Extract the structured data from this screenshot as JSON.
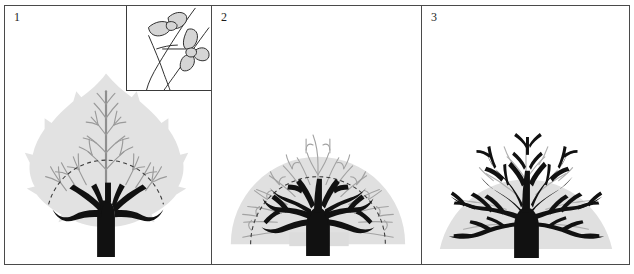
{
  "figure": {
    "background_color": "#ffffff",
    "border_color": "#4a4a4a",
    "width": 634,
    "height": 274
  },
  "palette": {
    "silhouette_fill": "#e2e2e2",
    "silhouette_fill_dark": "#d8d8d8",
    "fine_vein_gray": "#9a9a9a",
    "fine_vein_gray_light": "#b5b5b5",
    "branch_black": "#111111",
    "dashed_arc": "#3c3c3c",
    "inset_leaf_fill": "#d5d5d5",
    "inset_line": "#2b2b2b",
    "panel_border": "#4a4a4a"
  },
  "panels": [
    {
      "number": "1",
      "caption": "",
      "silhouette_shape": "leaf",
      "has_inset": true,
      "dashed_arc_visible": true,
      "black_branch_order_count": 2,
      "fine_gray_vein_count": 26,
      "inset": {
        "content": "twig-with-paired-leaves",
        "leaf_count": 5,
        "stem_count": 3
      }
    },
    {
      "number": "2",
      "caption": "",
      "silhouette_shape": "semicircular-fan",
      "has_inset": false,
      "dashed_arc_visible": true,
      "black_branch_order_count": 3,
      "fine_gray_vein_count": 44
    },
    {
      "number": "3",
      "caption": "",
      "silhouette_shape": "semicircular-fan",
      "has_inset": false,
      "dashed_arc_visible": false,
      "black_branch_order_count": 5,
      "fine_gray_vein_count": 30
    }
  ]
}
